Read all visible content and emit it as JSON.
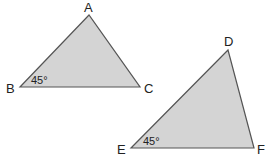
{
  "diagram": {
    "colors": {
      "fill": "#d4d4d4",
      "stroke": "#555555",
      "text": "#222222"
    },
    "triangles": [
      {
        "name": "ABC",
        "vertices": {
          "top": "A",
          "left": "B",
          "right": "C"
        },
        "angle": {
          "vertex": "B",
          "label": "45°"
        }
      },
      {
        "name": "DEF",
        "vertices": {
          "top": "D",
          "left": "E",
          "right": "F"
        },
        "angle": {
          "vertex": "E",
          "label": "45°"
        }
      }
    ]
  }
}
